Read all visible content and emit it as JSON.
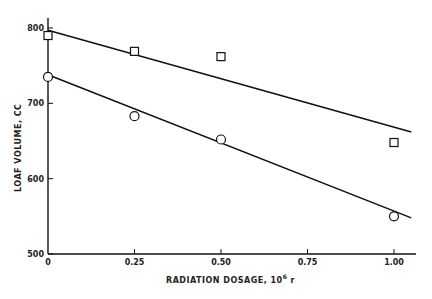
{
  "chart_data": {
    "type": "scatter",
    "title": "",
    "xlabel": "RADIATION DOSAGE, 10",
    "xlabel_sup": "6",
    "xlabel_unit": " r",
    "ylabel": "LOAF VOLUME, CC",
    "xlim": [
      0,
      1.07
    ],
    "ylim": [
      500,
      820
    ],
    "x_ticks": [
      0,
      0.25,
      0.5,
      0.75,
      1.0
    ],
    "x_tick_labels": [
      "0",
      "0.25",
      "0.50",
      "0.75",
      "1.00"
    ],
    "y_ticks": [
      500,
      600,
      700,
      800
    ],
    "y_tick_labels": [
      "500",
      "600",
      "700",
      "800"
    ],
    "grid": false,
    "legend": null,
    "series": [
      {
        "name": "squares",
        "marker": "square",
        "x": [
          0,
          0.25,
          0.5,
          1.0
        ],
        "y": [
          790,
          769,
          762,
          648
        ]
      },
      {
        "name": "circles",
        "marker": "circle",
        "x": [
          0,
          0.25,
          0.5,
          1.0
        ],
        "y": [
          735,
          683,
          652,
          550
        ]
      }
    ],
    "fit_lines": [
      {
        "name": "squares-fit",
        "x": [
          0,
          1.05
        ],
        "y": [
          797,
          662
        ]
      },
      {
        "name": "circles-fit",
        "x": [
          0,
          1.05
        ],
        "y": [
          738,
          548
        ]
      }
    ]
  }
}
